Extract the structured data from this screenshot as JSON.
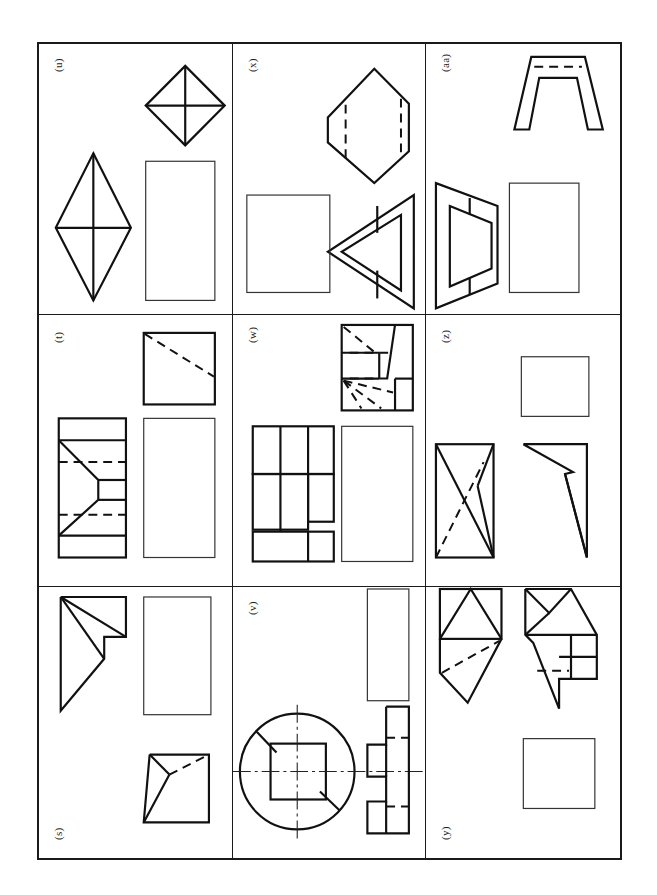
{
  "sheet": {
    "title": "Orthographic projection exercise sheet",
    "orientation": "landscape-rotated",
    "grid": {
      "rows": 3,
      "columns": 3
    },
    "frame_color": "#1a1a1a",
    "background_color": "#ffffff",
    "line_colors": {
      "visible_edge": "#111111",
      "hidden_edge": "#111111",
      "center_line": "#222222",
      "blank_view_box": "#333333"
    }
  },
  "panels": [
    {
      "id": "panel-u",
      "label": "(u)",
      "row": 1,
      "column": 1,
      "label_position": "top-left",
      "views": [
        {
          "name": "diamond-with-cross-view",
          "type": "given",
          "shape": "square rotated 45 degrees with full vertical and horizontal diagonals"
        },
        {
          "name": "tall-rhombus-view",
          "type": "given",
          "shape": "tall rhombus with vertical and horizontal diagonals"
        },
        {
          "name": "blank-view-box",
          "type": "blank",
          "shape": "empty tall rectangle to be completed"
        }
      ]
    },
    {
      "id": "panel-x",
      "label": "(x)",
      "row": 1,
      "column": 2,
      "label_position": "top-left",
      "views": [
        {
          "name": "hexagonal-block-view",
          "type": "given",
          "shape": "elongated hexagon with two vertical hidden lines"
        },
        {
          "name": "nested-triangle-view",
          "type": "given",
          "shape": "triangle with inner triangle outline forming a hollow frame"
        },
        {
          "name": "blank-view-box",
          "type": "blank",
          "shape": "empty square to be completed"
        }
      ]
    },
    {
      "id": "panel-aa",
      "label": "(aa)",
      "row": 1,
      "column": 3,
      "label_position": "top-left",
      "views": [
        {
          "name": "arch-bracket-view",
          "type": "given",
          "shape": "inverted U arch with tapered legs and a hidden line across the top"
        },
        {
          "name": "tapered-frame-triangle-view",
          "type": "given",
          "shape": "trapezoidal outline containing an inner triangular frame"
        },
        {
          "name": "blank-view-box",
          "type": "blank",
          "shape": "empty rectangle to be completed"
        }
      ]
    },
    {
      "id": "panel-t",
      "label": "(t)",
      "row": 2,
      "column": 1,
      "label_position": "top-left",
      "views": [
        {
          "name": "square-with-diagonal-view",
          "type": "given",
          "shape": "square with a hidden diagonal line"
        },
        {
          "name": "stepped-dovetail-view",
          "type": "given",
          "shape": "rectangular block with a notched V cut and two hidden lines"
        },
        {
          "name": "blank-view-box",
          "type": "blank",
          "shape": "empty tall rectangle to be completed"
        }
      ]
    },
    {
      "id": "panel-w",
      "label": "(w)",
      "row": 2,
      "column": 2,
      "label_position": "top-left",
      "views": [
        {
          "name": "inclined-block-view",
          "type": "given",
          "shape": "square outline with inclined face and several hidden lines radiating from lower left"
        },
        {
          "name": "stepped-plan-view",
          "type": "given",
          "shape": "compound rectangular outline divided into multiple cells"
        },
        {
          "name": "blank-view-box",
          "type": "blank",
          "shape": "empty tall rectangle to be completed"
        }
      ]
    },
    {
      "id": "panel-z",
      "label": "(z)",
      "row": 2,
      "column": 3,
      "label_position": "top-left",
      "views": [
        {
          "name": "blank-view-box",
          "type": "blank",
          "shape": "empty rectangle to be completed"
        },
        {
          "name": "crossed-wedge-view",
          "type": "given",
          "shape": "rectangle with crossing diagonals and one hidden diagonal"
        },
        {
          "name": "arrow-wedge-view",
          "type": "given",
          "shape": "narrow triangular wedge with a re-entrant notch"
        }
      ]
    },
    {
      "id": "panel-s",
      "label": "(s)",
      "row": 3,
      "column": 1,
      "label_position": "bottom-left",
      "views": [
        {
          "name": "triangular-step-view",
          "type": "given",
          "shape": "right triangle with a small stepped notch at the right"
        },
        {
          "name": "blank-view-box",
          "type": "blank",
          "shape": "empty tall rectangle to be completed"
        },
        {
          "name": "inclined-wedge-view",
          "type": "given",
          "shape": "wedge shape with hidden diagonal line"
        }
      ]
    },
    {
      "id": "panel-v",
      "label": "(v)",
      "row": 3,
      "column": 2,
      "label_position": "top-left",
      "views": [
        {
          "name": "blank-view-box",
          "type": "blank",
          "shape": "empty narrow rectangle to be completed"
        },
        {
          "name": "circular-flange-view",
          "type": "given",
          "shape": "circle with centre lines, an inner square and two short chamfer lines"
        },
        {
          "name": "stepped-side-view",
          "type": "given",
          "shape": "narrow stepped profile with hidden lines and a horizontal centre line"
        }
      ]
    },
    {
      "id": "panel-y",
      "label": "(y)",
      "row": 3,
      "column": 3,
      "label_position": "bottom-left",
      "views": [
        {
          "name": "pointed-roof-left-view",
          "type": "given",
          "shape": "square with triangular roof above and pointed wedge below with a hidden line"
        },
        {
          "name": "pointed-roof-right-view",
          "type": "given",
          "shape": "square with triangular roof and offset lower rectangle with hidden line"
        },
        {
          "name": "blank-view-box",
          "type": "blank",
          "shape": "empty square to be completed"
        }
      ]
    }
  ]
}
